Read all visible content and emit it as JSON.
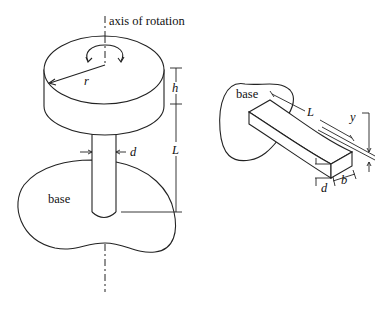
{
  "figure": {
    "left_diagram": {
      "title_label": "axis of rotation",
      "base_label": "base",
      "dimensions": {
        "radius": "r",
        "disk_height": "h",
        "rod_length": "L",
        "rod_diameter": "d"
      }
    },
    "right_diagram": {
      "base_label": "base",
      "dimensions": {
        "beam_length": "L",
        "deflection": "y",
        "thickness": "d",
        "width": "b"
      }
    }
  }
}
